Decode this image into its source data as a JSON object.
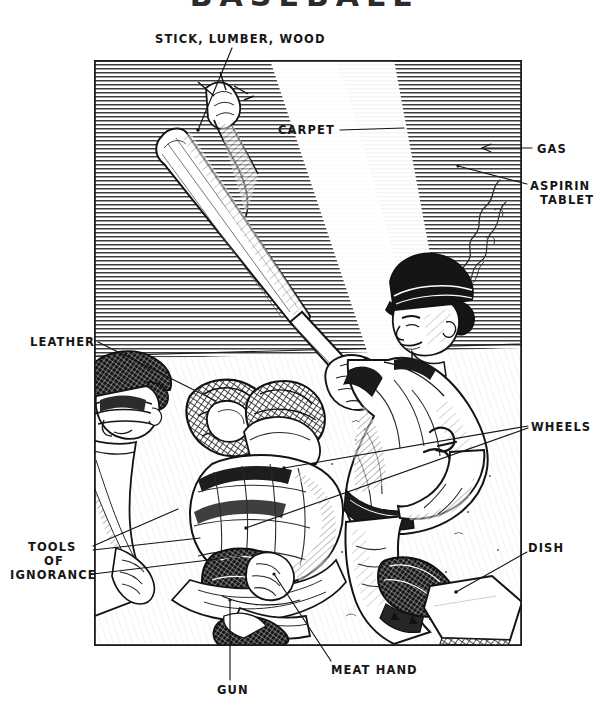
{
  "page": {
    "title_sliver": "BASEBALL",
    "background": "#ffffff",
    "ink": "#161616",
    "width": 608,
    "height": 724
  },
  "frame": {
    "x": 94,
    "y": 60,
    "width": 428,
    "height": 586,
    "border_color": "#1a1a1a"
  },
  "illustration": {
    "name": "baseball-batter-scene",
    "description": "Pen-and-ink crosshatch drawing of a right-handed batter finishing a swing, a crouching catcher and an umpire behind him, home plate at lower right, and a smoking baseball streaking away at upper right.",
    "figures": [
      {
        "name": "batter",
        "note": "follow-through swing, batting helmet, jersey, pants, cleated shoe"
      },
      {
        "name": "catcher",
        "note": "crouched, mask, chest protector, shin guards, mitt"
      },
      {
        "name": "umpire",
        "note": "behind catcher, cap and mask, leaning in"
      },
      {
        "name": "home-plate",
        "note": "five sided white slab, lower right"
      },
      {
        "name": "baseball",
        "note": "small circle with smoke trail, upper right"
      },
      {
        "name": "bat",
        "note": "wooden bat, barrel up and to the left"
      }
    ]
  },
  "labels": [
    {
      "id": "stick-lumber-wood",
      "lines": [
        "STICK, LUMBER, WOOD"
      ],
      "x": 155,
      "y": 32,
      "align": "left",
      "points_to": "bat"
    },
    {
      "id": "carpet",
      "lines": [
        "CARPET"
      ],
      "x": 278,
      "y": 130,
      "align": "left",
      "points_to": "outfield-grass"
    },
    {
      "id": "gas",
      "lines": [
        "GAS"
      ],
      "x": 536,
      "y": 143,
      "align": "left",
      "points_to": "smoke-trail"
    },
    {
      "id": "aspirin-tablet",
      "lines": [
        "ASPIRIN",
        "TABLET"
      ],
      "x": 530,
      "y": 180,
      "align": "left",
      "points_to": "baseball"
    },
    {
      "id": "leather",
      "lines": [
        "LEATHER"
      ],
      "x": 30,
      "y": 336,
      "align": "left",
      "points_to": "catchers-mitt"
    },
    {
      "id": "wheels",
      "lines": [
        "WHEELS"
      ],
      "x": 531,
      "y": 421,
      "align": "left",
      "points_to": "batter-legs"
    },
    {
      "id": "tools-of-ignorance",
      "lines": [
        "TOOLS",
        "OF",
        "IGNORANCE"
      ],
      "x": 28,
      "y": 541,
      "align": "left",
      "points_to": "catcher-gear"
    },
    {
      "id": "dish",
      "lines": [
        "DISH"
      ],
      "x": 528,
      "y": 542,
      "align": "left",
      "points_to": "home-plate"
    },
    {
      "id": "meat-hand",
      "lines": [
        "MEAT HAND"
      ],
      "x": 330,
      "y": 665,
      "align": "left",
      "points_to": "catcher-bare-hand"
    },
    {
      "id": "gun",
      "lines": [
        "GUN"
      ],
      "x": 217,
      "y": 684,
      "align": "left",
      "points_to": "catcher-throwing-arm"
    }
  ],
  "leader_lines": [
    {
      "id": "lead-stick",
      "from": [
        232,
        48
      ],
      "to": [
        198,
        128
      ]
    },
    {
      "id": "lead-carpet",
      "from": [
        338,
        128
      ],
      "to": [
        398,
        128
      ]
    },
    {
      "id": "lead-gas",
      "from": [
        531,
        148
      ],
      "to": [
        480,
        148
      ],
      "arrow": true
    },
    {
      "id": "lead-aspirin",
      "from": [
        527,
        184
      ],
      "to": [
        458,
        165
      ]
    },
    {
      "id": "lead-leather",
      "from": [
        97,
        342
      ],
      "to": [
        214,
        400
      ]
    },
    {
      "id": "lead-wheels-a",
      "from": [
        528,
        426
      ],
      "to": [
        283,
        467
      ]
    },
    {
      "id": "lead-wheels-b",
      "from": [
        528,
        428
      ],
      "to": [
        245,
        527
      ]
    },
    {
      "id": "lead-tools-a",
      "from": [
        92,
        546
      ],
      "to": [
        175,
        508
      ]
    },
    {
      "id": "lead-tools-b",
      "from": [
        92,
        550
      ],
      "to": [
        196,
        537
      ]
    },
    {
      "id": "lead-tools-c",
      "from": [
        92,
        575
      ],
      "to": [
        240,
        556
      ]
    },
    {
      "id": "lead-dish",
      "from": [
        527,
        552
      ],
      "to": [
        455,
        592
      ]
    },
    {
      "id": "lead-meat",
      "from": [
        330,
        662
      ],
      "to": [
        272,
        573
      ]
    },
    {
      "id": "lead-gun",
      "from": [
        229,
        681
      ],
      "to": [
        229,
        600
      ]
    }
  ]
}
